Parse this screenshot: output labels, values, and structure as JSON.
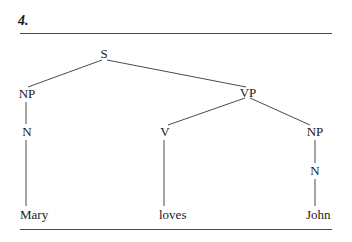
{
  "figure": {
    "number": "4."
  },
  "tree": {
    "root": "S",
    "nodes": {
      "s": "S",
      "np_subject": "NP",
      "vp": "VP",
      "n_subject": "N",
      "v": "V",
      "np_object": "NP",
      "n_object": "N"
    },
    "leaves": {
      "mary": "Mary",
      "loves": "loves",
      "john": "John"
    },
    "structure": [
      {
        "parent": "S",
        "children": [
          "NP",
          "VP"
        ]
      },
      {
        "parent": "NP",
        "children": [
          "N"
        ]
      },
      {
        "parent": "N",
        "children": [
          "Mary"
        ]
      },
      {
        "parent": "VP",
        "children": [
          "V",
          "NP"
        ]
      },
      {
        "parent": "V",
        "children": [
          "loves"
        ]
      },
      {
        "parent": "NP",
        "children": [
          "N"
        ]
      },
      {
        "parent": "N",
        "children": [
          "John"
        ]
      }
    ]
  },
  "colors": {
    "line": "#4a4a4a",
    "text": "#1a1a1a"
  }
}
